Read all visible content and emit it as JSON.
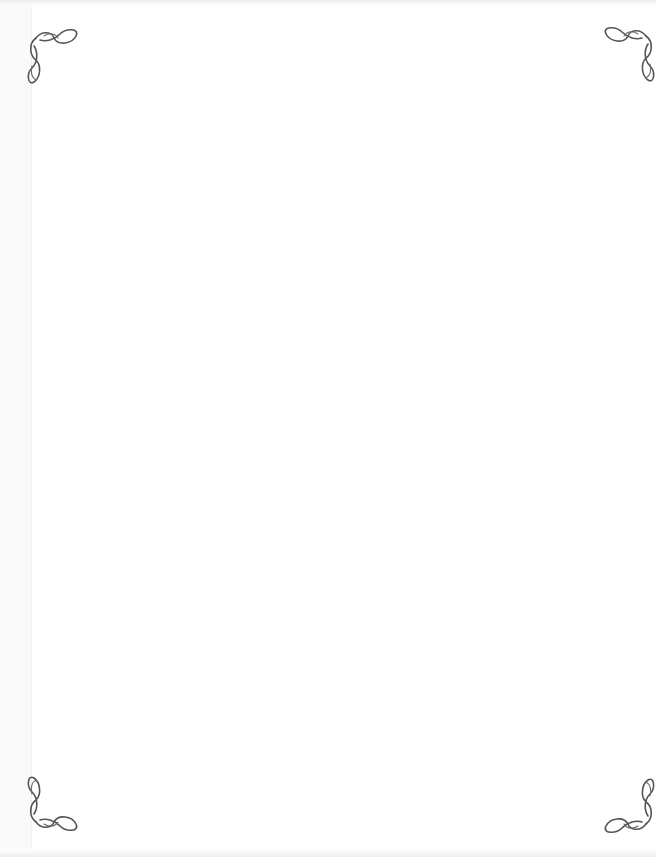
{
  "page": {
    "type": "blank-decorated-page",
    "background_color": "#ffffff",
    "ornament_color": "#555555",
    "body_text": ""
  },
  "ornaments": [
    {
      "position": "top-left",
      "icon": "corner-flourish-icon"
    },
    {
      "position": "top-right",
      "icon": "corner-flourish-icon"
    },
    {
      "position": "bottom-left",
      "icon": "corner-flourish-icon"
    },
    {
      "position": "bottom-right",
      "icon": "corner-flourish-icon"
    }
  ]
}
